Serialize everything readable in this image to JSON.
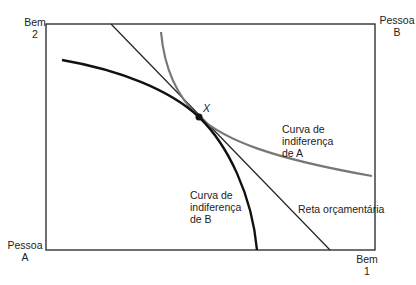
{
  "diagram": {
    "type": "edgeworth-box",
    "corner_labels": {
      "top_left": {
        "line1": "Bem",
        "line2": "2"
      },
      "top_right": {
        "line1": "Pessoa",
        "line2": "B"
      },
      "bottom_left": {
        "line1": "Pessoa",
        "line2": "A"
      },
      "bottom_right": {
        "line1": "Bem",
        "line2": "1"
      }
    },
    "point_label": "X",
    "curve_a_label": {
      "line1": "Curva de",
      "line2": "indiferença",
      "line3": "de A"
    },
    "curve_b_label": {
      "line1": "Curva de",
      "line2": "indiferença",
      "line3": "de B"
    },
    "budget_line_label": "Reta orçamentária",
    "colors": {
      "box": "#222222",
      "curve_a": "#777777",
      "curve_b": "#111111",
      "budget_line": "#222222",
      "point": "#111111"
    }
  }
}
